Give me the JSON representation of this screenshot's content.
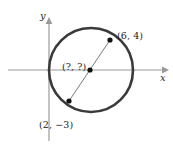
{
  "figure": {
    "background_color": "#ffffff"
  },
  "axes": {
    "x_label": "x",
    "y_label": "y",
    "color": "#9a9a9a",
    "origin_px": {
      "x": 49,
      "y": 70
    },
    "x_axis": {
      "start_px": 8,
      "end_px": 166,
      "y_px": 70,
      "arrow": "right"
    },
    "y_axis": {
      "start_px": 20,
      "end_px": 141,
      "x_px": 49,
      "arrow": "up"
    }
  },
  "circle": {
    "name": "circle",
    "stroke_color": "#3a3a3a",
    "stroke_width": 2.6,
    "fill": "none",
    "center_px": {
      "x": 91,
      "y": 70
    },
    "radius_px": 42
  },
  "diameter": {
    "name": "diameter-segment",
    "stroke_color": "#555555",
    "stroke_width": 0.8,
    "from_px": {
      "x": 110,
      "y": 40
    },
    "to_px": {
      "x": 69,
      "y": 101
    }
  },
  "points": [
    {
      "id": "point-upper-right",
      "label": "(6, 4)",
      "coords": [
        6,
        4
      ],
      "px": {
        "x": 110,
        "y": 40
      },
      "dot_color": "#111111",
      "dot_radius": 2.6
    },
    {
      "id": "point-lower-left",
      "label": "(2, −3)",
      "coords": [
        2,
        -3
      ],
      "px": {
        "x": 69,
        "y": 101
      },
      "dot_color": "#111111",
      "dot_radius": 2.6
    },
    {
      "id": "point-center",
      "label": "(?, ?)",
      "coords": null,
      "px": {
        "x": 90,
        "y": 70
      },
      "dot_color": "#111111",
      "dot_radius": 2.6
    }
  ]
}
